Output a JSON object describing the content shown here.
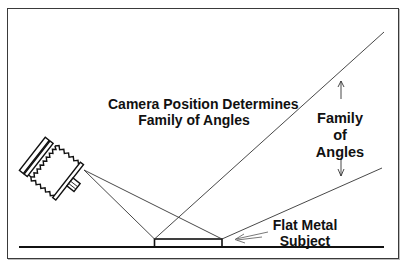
{
  "diagram": {
    "title_line1": "Camera Position Determines",
    "title_line2": "Family of Angles",
    "family_label": {
      "line1": "Family",
      "line2": "of",
      "line3": "Angles"
    },
    "subject_label": {
      "line1": "Flat Metal",
      "line2": "Subject"
    },
    "colors": {
      "stroke": "#111111",
      "thin_line": "#333333",
      "background": "#ffffff"
    },
    "elements": [
      "camera",
      "ground-line",
      "flat-metal-subject",
      "camera-to-subject-lines",
      "reflection-lines",
      "family-of-angles-arrows",
      "subject-pointer-arrow"
    ]
  }
}
